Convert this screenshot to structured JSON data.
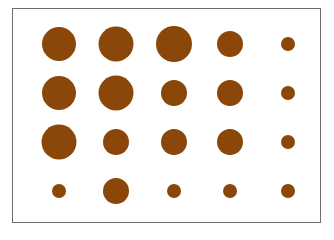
{
  "chart_data": {
    "type": "scatter",
    "subtype": "bubble-grid",
    "title": "",
    "xlabel": "",
    "ylabel": "",
    "grid": false,
    "legend": null,
    "dot_color": "#8a4709",
    "frame_color": "#6e6e6e",
    "rows": 4,
    "cols": 5,
    "size_levels": {
      "large": 35,
      "medium": 26,
      "small": 14
    },
    "column_centers_px": [
      59,
      116,
      174,
      230,
      288
    ],
    "row_centers_px": [
      44,
      93,
      142,
      191
    ],
    "diameters": [
      [
        34,
        35,
        36,
        26,
        14
      ],
      [
        34,
        35,
        26,
        26,
        14
      ],
      [
        35,
        26,
        26,
        26,
        14
      ],
      [
        14,
        26,
        14,
        14,
        14
      ]
    ],
    "size_class": [
      [
        "large",
        "large",
        "large",
        "medium",
        "small"
      ],
      [
        "large",
        "large",
        "medium",
        "medium",
        "small"
      ],
      [
        "large",
        "medium",
        "medium",
        "medium",
        "small"
      ],
      [
        "small",
        "medium",
        "small",
        "small",
        "small"
      ]
    ]
  }
}
